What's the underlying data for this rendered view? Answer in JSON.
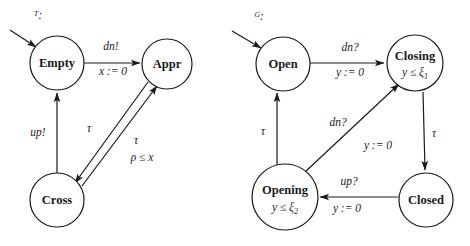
{
  "figure": {
    "kind": "timed-automata-pair",
    "background_color": "#ffffff",
    "line_color": "#1a1a1a"
  },
  "train_automaton": {
    "title": "ᵀ:",
    "states": [
      {
        "id": "empty",
        "label": "Empty",
        "invariant": "",
        "cx": 57,
        "cy": 63,
        "r": 27,
        "initial": true
      },
      {
        "id": "appr",
        "label": "Appr",
        "invariant": "",
        "cx": 167,
        "cy": 64,
        "r": 25,
        "initial": false
      },
      {
        "id": "cross",
        "label": "Cross",
        "invariant": "",
        "cx": 57,
        "cy": 200,
        "r": 27,
        "initial": false
      }
    ],
    "transitions": [
      {
        "from": "empty",
        "to": "appr",
        "action": "dn!",
        "guard": "",
        "reset": "x := 0"
      },
      {
        "from": "cross",
        "to": "empty",
        "action": "up!",
        "guard": "",
        "reset": ""
      },
      {
        "from": "appr",
        "to": "cross",
        "action": "τ",
        "guard": "",
        "reset": ""
      },
      {
        "from": "cross",
        "to": "appr",
        "action": "τ",
        "guard": "ρ ≤ x",
        "reset": ""
      }
    ],
    "labels": {
      "dn_bang": "dn!",
      "x_reset": "x := 0",
      "up_bang": "up!",
      "tau_down": "τ",
      "tau_up": "τ",
      "rho_guard": "ρ ≤ x"
    }
  },
  "gate_automaton": {
    "title": "ᴳ:",
    "states": [
      {
        "id": "open",
        "label": "Open",
        "invariant": "",
        "inv_var": "",
        "inv_bound": "",
        "cx": 283,
        "cy": 64,
        "r": 27,
        "initial": true
      },
      {
        "id": "closing",
        "label": "Closing",
        "invariant": "y ≤ ξ1",
        "inv_var": "y ≤ ξ",
        "inv_bound": "1",
        "cx": 415,
        "cy": 63,
        "r": 28,
        "initial": false
      },
      {
        "id": "closed",
        "label": "Closed",
        "invariant": "",
        "inv_var": "",
        "inv_bound": "",
        "cx": 426,
        "cy": 200,
        "r": 27,
        "initial": false
      },
      {
        "id": "opening",
        "label": "Opening",
        "invariant": "y ≤ ξ2",
        "inv_var": "y ≤ ξ",
        "inv_bound": "2",
        "cx": 285,
        "cy": 197,
        "r": 33,
        "initial": false
      }
    ],
    "transitions": [
      {
        "from": "open",
        "to": "closing",
        "action": "dn?",
        "reset": "y := 0"
      },
      {
        "from": "closing",
        "to": "closed",
        "action": "τ",
        "reset": ""
      },
      {
        "from": "closed",
        "to": "opening",
        "action": "up?",
        "reset": "y := 0"
      },
      {
        "from": "opening",
        "to": "open",
        "action": "τ",
        "reset": ""
      },
      {
        "from": "opening",
        "to": "closing",
        "action": "dn?",
        "reset": "y := 0"
      }
    ],
    "labels": {
      "dn_top": "dn?",
      "y_reset_top": "y := 0",
      "dn_diag": "dn?",
      "y_reset_diag": "y := 0",
      "up_bottom": "up?",
      "y_reset_bottom": "y := 0",
      "tau_left": "τ",
      "tau_right": "τ"
    }
  }
}
